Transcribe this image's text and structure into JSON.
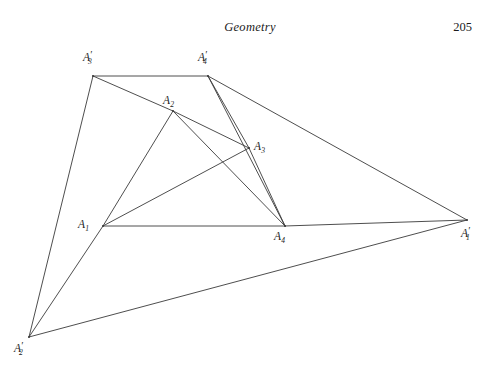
{
  "page": {
    "running_head_title": "Geometry",
    "folio": "205",
    "background_color": "#ffffff",
    "width": 500,
    "height": 369
  },
  "figure": {
    "name": "quadrilateral-construction-diagram",
    "stroke_color": "#3a3a3a",
    "stroke_width": 0.9,
    "vertices": [
      {
        "id": "A1",
        "base": "A",
        "sub": "1",
        "prime": false,
        "x": 103,
        "y": 226,
        "label_x": 78,
        "label_y": 219
      },
      {
        "id": "A2",
        "base": "A",
        "sub": "2",
        "prime": false,
        "x": 173,
        "y": 111,
        "label_x": 163,
        "label_y": 95
      },
      {
        "id": "A3",
        "base": "A",
        "sub": "3",
        "prime": false,
        "x": 249,
        "y": 148,
        "label_x": 254,
        "label_y": 141
      },
      {
        "id": "A4",
        "base": "A",
        "sub": "4",
        "prime": false,
        "x": 285,
        "y": 226,
        "label_x": 274,
        "label_y": 231
      },
      {
        "id": "A1p",
        "base": "A",
        "sub": "1",
        "prime": true,
        "x": 467,
        "y": 220,
        "label_x": 461,
        "label_y": 228
      },
      {
        "id": "A2p",
        "base": "A",
        "sub": "2",
        "prime": true,
        "x": 29,
        "y": 337,
        "label_x": 14,
        "label_y": 343
      },
      {
        "id": "A3p",
        "base": "A",
        "sub": "3",
        "prime": true,
        "x": 93,
        "y": 76,
        "label_x": 83,
        "label_y": 52
      },
      {
        "id": "A4p",
        "base": "A",
        "sub": "4",
        "prime": true,
        "x": 208,
        "y": 76,
        "label_x": 198,
        "label_y": 52
      }
    ],
    "edges": [
      {
        "id": "edge-A3p-A4p",
        "from": "A3p",
        "to": "A4p"
      },
      {
        "id": "edge-A4p-A1p",
        "from": "A4p",
        "to": "A1p"
      },
      {
        "id": "edge-A1p-A2p",
        "from": "A1p",
        "to": "A2p"
      },
      {
        "id": "edge-A2p-A3p",
        "from": "A2p",
        "to": "A3p"
      },
      {
        "id": "edge-A3p-A2",
        "from": "A3p",
        "to": "A2"
      },
      {
        "id": "edge-A2-A3",
        "from": "A2",
        "to": "A3"
      },
      {
        "id": "edge-A2-A4",
        "from": "A2",
        "to": "A4"
      },
      {
        "id": "edge-A3-A4",
        "from": "A3",
        "to": "A4"
      },
      {
        "id": "edge-A4p-A3",
        "from": "A4p",
        "to": "A3"
      },
      {
        "id": "edge-A4p-A4",
        "from": "A4p",
        "to": "A4"
      },
      {
        "id": "edge-A2p-A1",
        "from": "A2p",
        "to": "A1"
      },
      {
        "id": "edge-A1-A2",
        "from": "A1",
        "to": "A2"
      },
      {
        "id": "edge-A1-A3",
        "from": "A1",
        "to": "A3"
      },
      {
        "id": "edge-A1-A4",
        "from": "A1",
        "to": "A4"
      },
      {
        "id": "edge-A4-A1p",
        "from": "A4",
        "to": "A1p"
      }
    ]
  }
}
